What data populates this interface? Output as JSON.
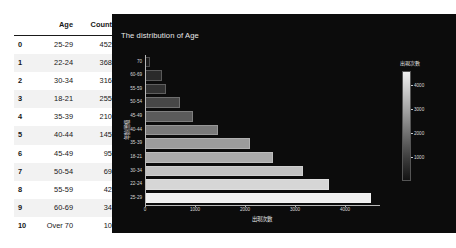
{
  "table": {
    "columns": [
      "",
      "Age",
      "Counts"
    ],
    "rows": [
      {
        "index": "0",
        "age": "25-29",
        "counts": "4527"
      },
      {
        "index": "1",
        "age": "22-24",
        "counts": "3680"
      },
      {
        "index": "2",
        "age": "30-34",
        "counts": "3163"
      },
      {
        "index": "3",
        "age": "18-21",
        "counts": "2554"
      },
      {
        "index": "4",
        "age": "35-39",
        "counts": "2101"
      },
      {
        "index": "5",
        "age": "40-44",
        "counts": "1452"
      },
      {
        "index": "6",
        "age": "45-49",
        "counts": "958"
      },
      {
        "index": "7",
        "age": "50-54",
        "counts": "698"
      },
      {
        "index": "8",
        "age": "55-59",
        "counts": "427"
      },
      {
        "index": "9",
        "age": "60-69",
        "counts": "341"
      },
      {
        "index": "10",
        "age": "Over 70",
        "counts": "100"
      }
    ]
  },
  "chart_panel": {
    "background": "#0c0c0c",
    "title": "The distribution of Age"
  },
  "colorbar": {
    "title": "出現次數",
    "ticks": [
      "4000",
      "3000",
      "2000",
      "1000"
    ],
    "tick_values": [
      4000,
      3000,
      2000,
      1000
    ],
    "vmin": 100,
    "vmax": 4527,
    "gradient_high": "#f0f0f0",
    "gradient_low": "#131313"
  },
  "chart_data": {
    "type": "bar",
    "orientation": "horizontal",
    "title": "The distribution of Age",
    "xlabel": "出現次數",
    "ylabel": "年齡層級",
    "xlim": [
      0,
      4700
    ],
    "xticks": [
      0,
      1000,
      2000,
      3000,
      4000
    ],
    "xtick_labels": [
      "0",
      "1000",
      "2000",
      "3000",
      "4000"
    ],
    "grid": false,
    "legend": "colorbar-right",
    "categories": [
      "70",
      "60-69",
      "55-59",
      "50-54",
      "45-49",
      "40-44",
      "35-39",
      "18-21",
      "30-34",
      "22-24",
      "25-29"
    ],
    "values": [
      100,
      341,
      427,
      698,
      958,
      1452,
      2101,
      2554,
      3163,
      3680,
      4527
    ],
    "colors": [
      "#1c1c1c",
      "#2b2b2b",
      "#323232",
      "#474747",
      "#5b5b5b",
      "#7a7a7a",
      "#9c9c9c",
      "#ababab",
      "#c2c2c2",
      "#d6d6d6",
      "#f0f0f0"
    ]
  }
}
